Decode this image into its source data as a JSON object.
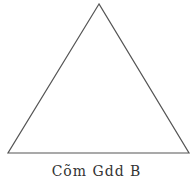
{
  "diagram": {
    "shape": "triangle",
    "stroke_color": "#555555",
    "fill_color": "#ffffff",
    "vertices": {
      "apex": [
        99,
        4
      ],
      "bottom_left": [
        8,
        153
      ],
      "bottom_right": [
        189,
        153
      ]
    }
  },
  "caption": {
    "text": "Cõm Gdd B"
  }
}
